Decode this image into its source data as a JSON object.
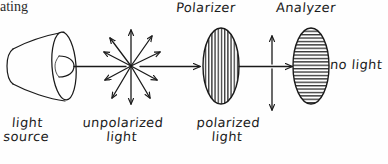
{
  "diagram": {
    "top_fragment": "ating",
    "stroke_color": "#1a1a1a",
    "background_color": "#fefefe"
  },
  "labels": {
    "polarizer": "Polarizer",
    "analyzer": "Analyzer",
    "no_light": "no light",
    "light_source_line1": "light",
    "light_source_line2": "source",
    "unpolarized_line1": "unpolarized",
    "unpolarized_line2": "light",
    "polarized_line1": "polarized",
    "polarized_line2": "light"
  },
  "elements": {
    "light_source": {
      "name": "light-source-cone",
      "cx": 45,
      "cy": 66
    },
    "unpolarized_burst": {
      "name": "unpolarized-light-burst",
      "cx": 131,
      "cy": 66,
      "ray_count": 12
    },
    "polarizer": {
      "name": "polarizer-ellipse",
      "cx": 221,
      "cy": 66,
      "rx": 18,
      "ry": 38,
      "hatch": "vertical"
    },
    "analyzer": {
      "name": "analyzer-ellipse",
      "cx": 311,
      "cy": 66,
      "rx": 18,
      "ry": 38,
      "hatch": "horizontal"
    },
    "polarized_arrow": {
      "name": "polarized-light-vertical-arrow",
      "x": 272,
      "y_top": 36,
      "y_bottom": 110
    }
  }
}
